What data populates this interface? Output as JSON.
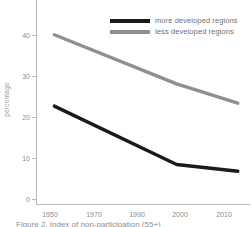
{
  "chart_data": {
    "type": "line",
    "title": "",
    "xlabel": "",
    "ylabel": "percentage",
    "xlim": [
      1944,
      2014
    ],
    "ylim": [
      0,
      50
    ],
    "grid": false,
    "legend_position": "top-center",
    "xticks": [
      "1950",
      "1970",
      "1990",
      "2000",
      "2010"
    ],
    "xtick_values": [
      1950,
      1970,
      1990,
      2000,
      2010
    ],
    "yticks": [
      "0",
      "10",
      "20",
      "30",
      "40",
      "50"
    ],
    "ytick_values": [
      0,
      10,
      20,
      30,
      40,
      50
    ],
    "x": [
      1950,
      1990,
      2010
    ],
    "series": [
      {
        "name": "more developed regions",
        "color": "#1a1a1a",
        "values": [
          23.3,
          9.4,
          7.8
        ]
      },
      {
        "name": "less developed regions",
        "color": "#8f8f8f",
        "values": [
          40.3,
          28.6,
          24.0
        ]
      }
    ]
  },
  "axis": {
    "ylabel": "percentage",
    "ytick_0": "0",
    "ytick_10": "10",
    "ytick_20": "20",
    "ytick_30": "30",
    "ytick_40": "40",
    "ytick_50": "50",
    "xtick_1950": "1950",
    "xtick_1970": "1970",
    "xtick_1990": "1990",
    "xtick_2000": "2000",
    "xtick_2010": "2010"
  },
  "legend": {
    "more_label": "more developed regions",
    "less_label": "less developed regions"
  },
  "caption": {
    "text": "Figure 2.  Index of non-participation (55+)"
  },
  "colors": {
    "more_developed": "#1a1a1a",
    "less_developed": "#8f8f8f",
    "axis": "#b9b9b9",
    "text": "#8c8c8c"
  }
}
